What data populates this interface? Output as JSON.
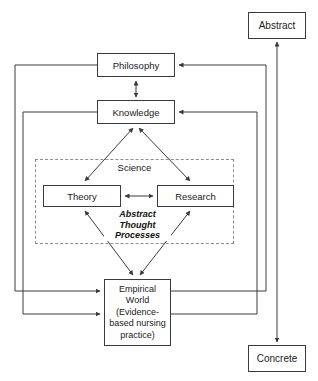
{
  "diagram": {
    "type": "flow-diagram",
    "line_color": "#3a3a3a",
    "dashed_color": "#8d8d8d",
    "background": "#ffffff",
    "nodes": {
      "abstract": {
        "label": "Abstract"
      },
      "concrete": {
        "label": "Concrete"
      },
      "philosophy": {
        "label": "Philosophy"
      },
      "knowledge": {
        "label": "Knowledge"
      },
      "theory": {
        "label": "Theory"
      },
      "research": {
        "label": "Research"
      },
      "empirical": {
        "label": "Empirical\nWorld\n(Evidence-\nbased nursing\npractice)"
      }
    },
    "groups": {
      "science": {
        "label": "Science",
        "style": "dashed"
      }
    },
    "annotations": {
      "abstract_thought_processes": {
        "label": "Abstract\nThought\nProcesses",
        "style": "bold-italic"
      }
    },
    "edges": [
      {
        "from": "concrete",
        "to": "abstract",
        "style": "double-arrow",
        "orientation": "vertical"
      },
      {
        "from": "knowledge",
        "to": "philosophy",
        "style": "double-arrow",
        "orientation": "vertical"
      },
      {
        "from": "knowledge",
        "to": "theory",
        "style": "double-arrow",
        "orientation": "diagonal"
      },
      {
        "from": "knowledge",
        "to": "research",
        "style": "double-arrow",
        "orientation": "diagonal"
      },
      {
        "from": "theory",
        "to": "research",
        "style": "double-arrow",
        "orientation": "horizontal"
      },
      {
        "from": "theory",
        "to": "empirical",
        "style": "double-arrow",
        "orientation": "diagonal"
      },
      {
        "from": "research",
        "to": "empirical",
        "style": "double-arrow",
        "orientation": "diagonal"
      },
      {
        "from": "philosophy",
        "to": "empirical",
        "style": "single-arrow",
        "orientation": "left-loop"
      },
      {
        "from": "knowledge",
        "to": "empirical",
        "style": "single-arrow",
        "orientation": "left-loop"
      },
      {
        "from": "empirical",
        "to": "philosophy",
        "style": "single-arrow",
        "orientation": "right-loop"
      },
      {
        "from": "empirical",
        "to": "knowledge",
        "style": "single-arrow",
        "orientation": "right-loop"
      }
    ]
  }
}
